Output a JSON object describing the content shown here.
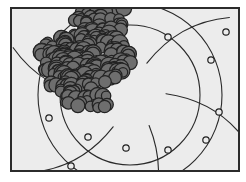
{
  "figure": {
    "title": "",
    "caption": "",
    "width": 246,
    "height": 182,
    "background_color": "#ffffff",
    "panel": {
      "x": 10,
      "y": 7,
      "width": 230,
      "height": 165,
      "fill_color": "#ececec",
      "border_color": "#2b2b2b",
      "border_width": 2
    }
  },
  "colors": {
    "blob_fill": "#6e6e6e",
    "blob_outline": "#232323",
    "grid_stroke": "#2a2a2a",
    "marker_fill": "#ececec",
    "marker_stroke": "#1f1f1f",
    "panel_fill": "#ececec"
  },
  "chart_data": {
    "type": "scatter",
    "title": "",
    "subtitle": "",
    "xlabel": "",
    "ylabel": "",
    "legend": [],
    "grid": true,
    "grid_description": "polar grid: two concentric circles plus curved radial spokes",
    "polar_grid": {
      "center_x": 130,
      "center_y": 95,
      "circle_radii": [
        70,
        92
      ],
      "spoke_count": 6,
      "spoke_curvature": 0.42
    },
    "markers": {
      "shape": "open-circle",
      "radius": 3.2,
      "count": 10,
      "points": [
        {
          "x": 168,
          "y": 37
        },
        {
          "x": 211,
          "y": 60
        },
        {
          "x": 226,
          "y": 32
        },
        {
          "x": 219,
          "y": 112
        },
        {
          "x": 206,
          "y": 140
        },
        {
          "x": 168,
          "y": 150
        },
        {
          "x": 126,
          "y": 148
        },
        {
          "x": 88,
          "y": 137
        },
        {
          "x": 71,
          "y": 166
        },
        {
          "x": 49,
          "y": 118
        }
      ]
    },
    "cluster": {
      "label": "granular aggregate",
      "fill": "#6e6e6e",
      "outline": "#232323",
      "grain_count": 280,
      "grain_radius_min": 4.5,
      "grain_radius_max": 8.5,
      "centroid_x": 82,
      "centroid_y": 62,
      "extent_x": [
        30,
        130
      ],
      "extent_y": [
        0,
        112
      ]
    }
  }
}
